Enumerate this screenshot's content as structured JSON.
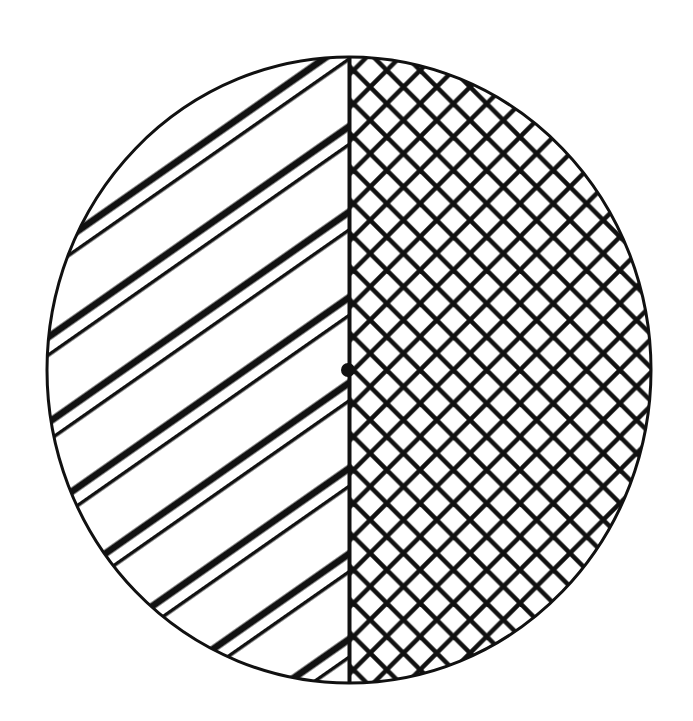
{
  "diagram": {
    "title": "Circle divided into two hatched halves",
    "shape": "circle",
    "center": {
      "x": 349,
      "y": 370
    },
    "radius_x": 302,
    "radius_y": 313,
    "outline_color": "#111111",
    "background": "#ffffff",
    "divider": {
      "orientation": "vertical",
      "x": 349,
      "width": 4
    },
    "center_dot": {
      "x": 348,
      "y": 370,
      "radius": 7
    },
    "regions": [
      {
        "side": "left",
        "label": "Left half",
        "pattern": "single diagonal hatch (lower-left to upper-right)",
        "angle_deg": 35,
        "spacing_px": 57,
        "line_width_px": 7
      },
      {
        "side": "right",
        "label": "Right half",
        "pattern": "diagonal cross-hatch (diamond grid)",
        "angle_deg": 45,
        "spacing_px": 23.5,
        "line_width_px": 4.5
      }
    ]
  }
}
